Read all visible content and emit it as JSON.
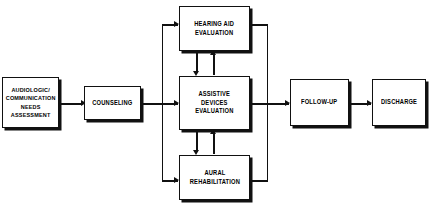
{
  "diagram": {
    "accent_color": "#111111",
    "background_color": "#ffffff",
    "nodes": [
      {
        "id": "assessment",
        "label": "AUDIOLOGIC/\nCOMMUNICATION\nNEEDS\nASSESSMENT"
      },
      {
        "id": "counseling",
        "label": "COUNSELING"
      },
      {
        "id": "hearing_aid",
        "label": "HEARING AID\nEVALUATION"
      },
      {
        "id": "assistive",
        "label": "ASSISTIVE\nDEVICES\nEVALUATION"
      },
      {
        "id": "aural",
        "label": "AURAL\nREHABILITATION"
      },
      {
        "id": "followup",
        "label": "FOLLOW-UP"
      },
      {
        "id": "discharge",
        "label": "DISCHARGE"
      }
    ],
    "edges": [
      {
        "from": "assessment",
        "to": "counseling",
        "direction": "right"
      },
      {
        "from": "counseling",
        "to": "hearing_aid",
        "direction": "right"
      },
      {
        "from": "counseling",
        "to": "assistive",
        "direction": "right"
      },
      {
        "from": "counseling",
        "to": "aural",
        "direction": "right"
      },
      {
        "from": "hearing_aid",
        "to": "assistive",
        "direction": "down"
      },
      {
        "from": "assistive",
        "to": "hearing_aid",
        "direction": "up"
      },
      {
        "from": "assistive",
        "to": "aural",
        "direction": "down"
      },
      {
        "from": "aural",
        "to": "assistive",
        "direction": "up"
      },
      {
        "from": "hearing_aid",
        "to": "followup",
        "direction": "right"
      },
      {
        "from": "assistive",
        "to": "followup",
        "direction": "right"
      },
      {
        "from": "aural",
        "to": "followup",
        "direction": "right"
      },
      {
        "from": "followup",
        "to": "discharge",
        "direction": "right"
      }
    ]
  }
}
